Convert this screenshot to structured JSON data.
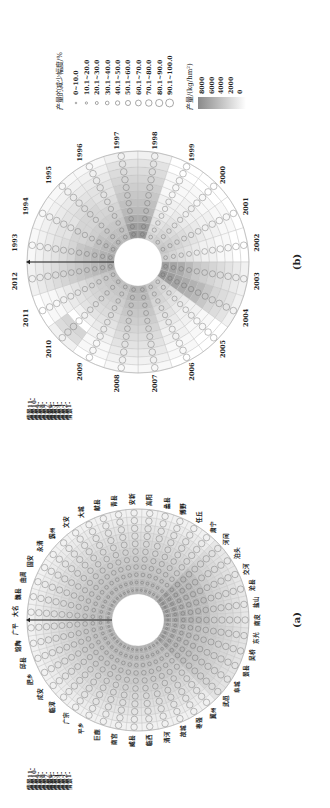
{
  "figure": {
    "orientation": "rotated 90° counter-clockwise",
    "panel_a_label": "(a)",
    "panel_b_label": "(b)"
  },
  "legend": {
    "circle_size_title": "产量的减少幅度/%",
    "circle_size_classes": [
      "0~10.0",
      "10.1~20.0",
      "20.1~30.0",
      "30.1~40.0",
      "40.1~50.0",
      "50.1~60.0",
      "60.1~70.0",
      "70.1~80.0",
      "80.1~90.0",
      "90.1~100.0"
    ],
    "yield_title": "产量/(kg/hm²)",
    "yield_ticks": [
      "8000",
      "6000",
      "4000",
      "2000",
      "0"
    ],
    "yield_color_high": "#8a8a8a",
    "yield_color_low": "#ffffff"
  },
  "scenarios": {
    "labels": [
      "情景11-",
      "情景10-",
      "情景9-",
      "情景8-",
      "情景7-",
      "情景6-",
      "情景5-",
      "情景4-",
      "情景3-",
      "情景2-",
      "情景1-"
    ]
  },
  "chart_data": [
    {
      "type": "heatmap",
      "subtype": "circular (radial) heatmap with proportional circles",
      "panel": "(a)",
      "sector_dimension": "county",
      "ring_dimension": "scenario (情景1 inner … 情景11 outer)",
      "categories": [
        "大名",
        "魏县",
        "曲周",
        "固安",
        "永清",
        "霸州",
        "文安",
        "大城",
        "献县",
        "青县",
        "安新",
        "高阳",
        "蠡县",
        "博野",
        "任丘",
        "肃宁",
        "河间",
        "泊头",
        "交河",
        "沧县",
        "盐山",
        "南皮",
        "东光",
        "吴桥",
        "景县",
        "阜城",
        "武邑",
        "冀州",
        "枣强",
        "故城",
        "清河",
        "临西",
        "威县",
        "南宫",
        "巨鹿",
        "平乡",
        "广宗",
        "临漳",
        "成安",
        "肥乡",
        "邱县",
        "馆陶",
        "广平"
      ],
      "rings": 11,
      "color_encoding": "yield kg/hm² (0–8000, white→gray)",
      "circle_encoding": "yield reduction % (0–100)"
    },
    {
      "type": "heatmap",
      "subtype": "circular (radial) heatmap with proportional circles",
      "panel": "(b)",
      "sector_dimension": "year",
      "categories": [
        "1993",
        "1994",
        "1995",
        "1996",
        "1997",
        "1998",
        "1999",
        "2000",
        "2001",
        "2002",
        "2003",
        "2004",
        "2005",
        "2006",
        "2007",
        "2008",
        "2009",
        "2010",
        "2011",
        "2012"
      ],
      "ring_dimension": "scenario (情景1 inner … 情景11 outer)",
      "rings": 11,
      "color_encoding": "yield kg/hm² (0–8000, white→gray)",
      "circle_encoding": "yield reduction % (0–100)",
      "shading_levels_by_year_inner_to_outer": {
        "1993": [
          0.6,
          0.55,
          0.5,
          0.45,
          0.4,
          0.3,
          0.25,
          0.2,
          0.15,
          0.1,
          0.05
        ],
        "1994": [
          0.55,
          0.5,
          0.45,
          0.35,
          0.3,
          0.3,
          0.2,
          0.2,
          0.15,
          0.1,
          0.05
        ],
        "1995": [
          0.5,
          0.45,
          0.4,
          0.35,
          0.3,
          0.3,
          0.25,
          0.2,
          0.15,
          0.1,
          0.05
        ],
        "1996": [
          0.5,
          0.45,
          0.4,
          0.35,
          0.3,
          0.25,
          0.2,
          0.2,
          0.15,
          0.1,
          0.05
        ],
        "1997": [
          0.75,
          0.7,
          0.6,
          0.5,
          0.45,
          0.4,
          0.35,
          0.3,
          0.25,
          0.2,
          0.1
        ],
        "1998": [
          0.75,
          0.7,
          0.6,
          0.5,
          0.45,
          0.4,
          0.35,
          0.3,
          0.25,
          0.2,
          0.1
        ],
        "1999": [
          0.3,
          0.25,
          0.2,
          0.15,
          0.1,
          0.1,
          0.05,
          0.05,
          0.05,
          0.0,
          0.0
        ],
        "2000": [
          0.35,
          0.3,
          0.25,
          0.2,
          0.15,
          0.1,
          0.1,
          0.05,
          0.05,
          0.0,
          0.0
        ],
        "2001": [
          0.4,
          0.35,
          0.3,
          0.25,
          0.2,
          0.15,
          0.1,
          0.1,
          0.05,
          0.05,
          0.0
        ],
        "2002": [
          0.35,
          0.3,
          0.25,
          0.2,
          0.15,
          0.1,
          0.1,
          0.05,
          0.05,
          0.0,
          0.0
        ],
        "2003": [
          0.7,
          0.65,
          0.6,
          0.5,
          0.4,
          0.35,
          0.3,
          0.25,
          0.2,
          0.15,
          0.1
        ],
        "2004": [
          0.75,
          0.7,
          0.65,
          0.6,
          0.55,
          0.5,
          0.4,
          0.3,
          0.25,
          0.2,
          0.1
        ],
        "2005": [
          0.35,
          0.3,
          0.25,
          0.2,
          0.15,
          0.1,
          0.1,
          0.05,
          0.05,
          0.0,
          0.0
        ],
        "2006": [
          0.4,
          0.35,
          0.3,
          0.25,
          0.2,
          0.15,
          0.1,
          0.1,
          0.05,
          0.05,
          0.0
        ],
        "2007": [
          0.55,
          0.5,
          0.45,
          0.4,
          0.35,
          0.3,
          0.25,
          0.2,
          0.15,
          0.1,
          0.05
        ],
        "2008": [
          0.55,
          0.5,
          0.45,
          0.4,
          0.35,
          0.3,
          0.25,
          0.2,
          0.15,
          0.1,
          0.05
        ],
        "2009": [
          0.45,
          0.4,
          0.35,
          0.3,
          0.25,
          0.2,
          0.15,
          0.1,
          0.05,
          0.05,
          0.0
        ],
        "2010": [
          0.45,
          0.4,
          0.35,
          0.3,
          0.25,
          0.2,
          0.1,
          0.0,
          0.3,
          0.25,
          0.1
        ],
        "2011": [
          0.45,
          0.4,
          0.35,
          0.3,
          0.25,
          0.2,
          0.15,
          0.1,
          0.05,
          0.05,
          0.0
        ],
        "2012": [
          0.6,
          0.55,
          0.5,
          0.45,
          0.4,
          0.35,
          0.3,
          0.25,
          0.2,
          0.15,
          0.1
        ]
      }
    }
  ]
}
